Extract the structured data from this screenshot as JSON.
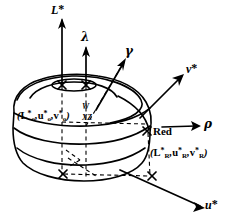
{
  "figure": {
    "background_color": "#ffffff",
    "ink_color": "#000000",
    "width": 230,
    "height": 220
  },
  "axes": [
    {
      "id": "lightness",
      "label": "L*",
      "symbol": "L",
      "star": "*",
      "kind": "vertical-solid-arrow",
      "x": 60,
      "y": 8
    },
    {
      "id": "lambda-axis",
      "label": "λ",
      "kind": "vertical-solid-arrow-short",
      "x": 86,
      "y": 36
    },
    {
      "id": "gamma-axis",
      "label": "γ",
      "kind": "diagonal-arrow-up-right",
      "x": 126,
      "y": 50
    },
    {
      "id": "v-star-axis",
      "label": "v*",
      "symbol": "v",
      "star": "*",
      "kind": "diagonal-arrow-up-right",
      "x": 190,
      "y": 67
    },
    {
      "id": "rho-axis",
      "label": "ρ",
      "kind": "horizontal-arrow-right",
      "x": 207,
      "y": 123
    },
    {
      "id": "u-star-axis",
      "label": "u*",
      "symbol": "u",
      "star": "*",
      "kind": "diagonal-arrow-down-right",
      "x": 208,
      "y": 202
    }
  ],
  "annotations": [
    {
      "id": "origin-coords",
      "text": "(L*o, u*o, v*o)",
      "parts": [
        "(",
        "L",
        "*",
        "o",
        ",",
        "u",
        "*",
        "o",
        ",",
        "v",
        "*",
        "o",
        ")"
      ],
      "x": 18,
      "y": 112
    },
    {
      "id": "xz-marker",
      "text": "XZ",
      "x": 84,
      "y": 118
    },
    {
      "id": "w-marker",
      "text": "W",
      "x": 83,
      "y": 108
    },
    {
      "id": "red-label",
      "text": "Red",
      "x": 154,
      "y": 133
    },
    {
      "id": "red-coords",
      "text": "(L*R, u*R, v*R)",
      "parts": [
        "(",
        "L",
        "*",
        "R",
        ",",
        "u",
        "*",
        "R",
        ",",
        "v",
        "*",
        "R",
        ")"
      ],
      "x": 152,
      "y": 150
    }
  ],
  "markers": [
    {
      "id": "marker-top-left",
      "glyph": "×",
      "x": 62,
      "y": 84
    },
    {
      "id": "marker-top-right",
      "glyph": "×",
      "x": 86,
      "y": 84
    },
    {
      "id": "marker-red-point",
      "glyph": "×",
      "x": 147,
      "y": 131
    },
    {
      "id": "marker-base-left",
      "glyph": "×",
      "x": 63,
      "y": 173
    },
    {
      "id": "marker-base-right",
      "glyph": "×",
      "x": 152,
      "y": 176
    }
  ],
  "solid": {
    "name": "color-solid-blob",
    "contour_count": 4,
    "has_top_cap": true,
    "description": "rounded lobed solid with horizontal contour bands"
  }
}
